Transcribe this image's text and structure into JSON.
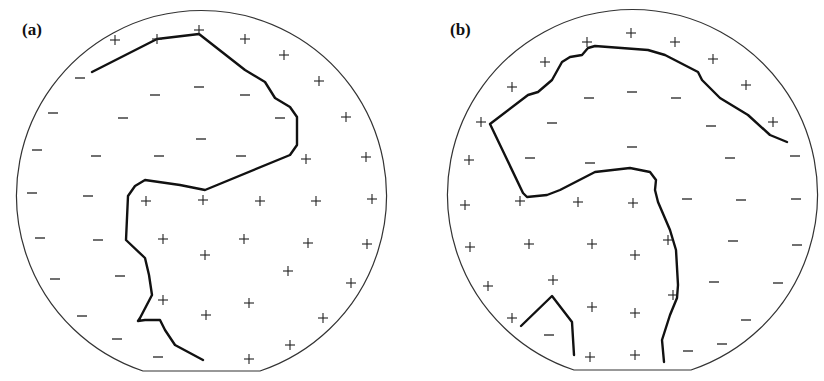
{
  "panels": [
    {
      "label": "(a)",
      "label_pos": [
        22,
        37
      ],
      "circle": {
        "cx": 202,
        "cy": 197,
        "r": 185,
        "flat_y": 371,
        "flat_x1": 143,
        "flat_x2": 260
      },
      "boundaries": [
        {
          "points": [
            [
              92,
              72
            ],
            [
              157,
              39
            ],
            [
              199,
              34
            ],
            [
              245,
              70
            ],
            [
              265,
              82
            ],
            [
              275,
              98
            ],
            [
              290,
              107
            ],
            [
              297,
              117
            ],
            [
              297,
              145
            ],
            [
              290,
              155
            ],
            [
              205,
              190
            ],
            [
              180,
              185
            ],
            [
              145,
              180
            ],
            [
              135,
              186
            ],
            [
              128,
              196
            ],
            [
              126,
              240
            ],
            [
              145,
              258
            ],
            [
              149,
              275
            ],
            [
              152,
              295
            ],
            [
              140,
              318
            ],
            [
              138,
              321
            ],
            [
              145,
              320
            ],
            [
              160,
              320
            ],
            [
              165,
              330
            ],
            [
              175,
              345
            ],
            [
              203,
              360
            ]
          ]
        }
      ],
      "plus": [
        [
          115,
          40
        ],
        [
          157,
          39
        ],
        [
          199,
          30
        ],
        [
          245,
          39
        ],
        [
          284,
          55
        ],
        [
          319,
          81
        ],
        [
          346,
          117
        ],
        [
          366,
          157
        ],
        [
          306,
          159
        ],
        [
          146,
          201
        ],
        [
          203,
          200
        ],
        [
          260,
          201
        ],
        [
          316,
          201
        ],
        [
          372,
          199
        ],
        [
          163,
          239
        ],
        [
          244,
          239
        ],
        [
          308,
          243
        ],
        [
          367,
          244
        ],
        [
          205,
          255
        ],
        [
          288,
          271
        ],
        [
          351,
          283
        ],
        [
          163,
          300
        ],
        [
          249,
          303
        ],
        [
          206,
          315
        ],
        [
          323,
          318
        ],
        [
          290,
          345
        ],
        [
          249,
          359
        ]
      ],
      "minus": [
        [
          80,
          78
        ],
        [
          155,
          95
        ],
        [
          199,
          87
        ],
        [
          245,
          95
        ],
        [
          280,
          118
        ],
        [
          53,
          113
        ],
        [
          123,
          118
        ],
        [
          201,
          139
        ],
        [
          37,
          150
        ],
        [
          96,
          156
        ],
        [
          159,
          156
        ],
        [
          241,
          156
        ],
        [
          32,
          193
        ],
        [
          88,
          196
        ],
        [
          40,
          238
        ],
        [
          98,
          240
        ],
        [
          55,
          279
        ],
        [
          120,
          276
        ],
        [
          82,
          316
        ],
        [
          117,
          339
        ],
        [
          158,
          357
        ]
      ]
    },
    {
      "label": "(b)",
      "label_pos": [
        450,
        37
      ],
      "circle": {
        "cx": 632,
        "cy": 195,
        "r": 185,
        "flat_y": 370,
        "flat_x1": 574,
        "flat_x2": 691
      },
      "boundaries": [
        {
          "points": [
            [
              787,
              142
            ],
            [
              770,
              135
            ],
            [
              748,
              115
            ],
            [
              720,
              98
            ],
            [
              702,
              80
            ],
            [
              698,
              72
            ],
            [
              665,
              55
            ],
            [
              648,
              50
            ],
            [
              595,
              46
            ],
            [
              588,
              48
            ],
            [
              582,
              55
            ],
            [
              570,
              57
            ],
            [
              562,
              62
            ],
            [
              552,
              80
            ],
            [
              538,
              92
            ],
            [
              528,
              95
            ],
            [
              490,
              124
            ],
            [
              523,
              193
            ],
            [
              527,
              197
            ],
            [
              547,
              195
            ],
            [
              560,
              190
            ],
            [
              595,
              172
            ],
            [
              630,
              168
            ],
            [
              650,
              172
            ],
            [
              656,
              180
            ],
            [
              655,
              190
            ],
            [
              658,
              202
            ],
            [
              670,
              230
            ],
            [
              676,
              250
            ],
            [
              678,
              285
            ],
            [
              677,
              298
            ],
            [
              670,
              315
            ],
            [
              662,
              340
            ],
            [
              664,
              362
            ]
          ]
        },
        {
          "points": [
            [
              521,
              326
            ],
            [
              552,
              296
            ],
            [
              572,
              322
            ],
            [
              574,
              355
            ]
          ]
        }
      ],
      "plus": [
        [
          631,
          33
        ],
        [
          587,
          42
        ],
        [
          675,
          42
        ],
        [
          545,
          62
        ],
        [
          713,
          59
        ],
        [
          512,
          87
        ],
        [
          746,
          85
        ],
        [
          481,
          122
        ],
        [
          773,
          122
        ],
        [
          469,
          160
        ],
        [
          465,
          205
        ],
        [
          520,
          201
        ],
        [
          578,
          202
        ],
        [
          633,
          203
        ],
        [
          668,
          240
        ],
        [
          470,
          247
        ],
        [
          529,
          244
        ],
        [
          592,
          244
        ],
        [
          635,
          255
        ],
        [
          488,
          286
        ],
        [
          553,
          280
        ],
        [
          592,
          307
        ],
        [
          635,
          313
        ],
        [
          673,
          295
        ],
        [
          512,
          318
        ],
        [
          590,
          357
        ],
        [
          635,
          355
        ]
      ],
      "minus": [
        [
          589,
          98
        ],
        [
          632,
          92
        ],
        [
          676,
          98
        ],
        [
          552,
          123
        ],
        [
          711,
          126
        ],
        [
          632,
          147
        ],
        [
          530,
          158
        ],
        [
          590,
          163
        ],
        [
          730,
          158
        ],
        [
          795,
          156
        ],
        [
          687,
          199
        ],
        [
          741,
          200
        ],
        [
          796,
          199
        ],
        [
          733,
          241
        ],
        [
          797,
          245
        ],
        [
          714,
          282
        ],
        [
          778,
          283
        ],
        [
          746,
          320
        ],
        [
          722,
          344
        ],
        [
          688,
          351
        ],
        [
          549,
          335
        ]
      ]
    }
  ]
}
